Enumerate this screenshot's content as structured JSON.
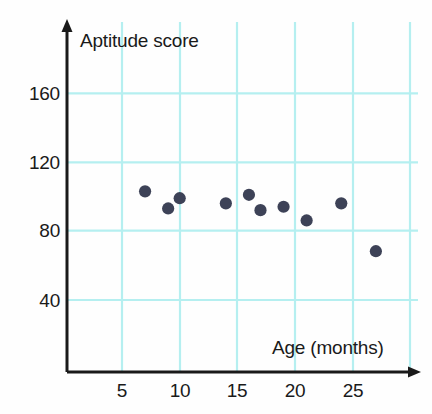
{
  "chart_data": {
    "type": "scatter",
    "title": "",
    "xlabel": "Age (months)",
    "ylabel": "Aptitude score",
    "xlim": [
      0,
      30
    ],
    "ylim": [
      0,
      180
    ],
    "xticks": [
      5,
      10,
      15,
      20,
      25
    ],
    "yticks": [
      40,
      80,
      120,
      160
    ],
    "xtick_labels": [
      "5",
      "10",
      "15",
      "20",
      "25"
    ],
    "ytick_labels": [
      "40",
      "80",
      "120",
      "160"
    ],
    "grid": true,
    "grid_color": "#b5eff0",
    "legend": "none",
    "marker_color": "#3d4257",
    "axis_color": "#1a1a1a",
    "points": [
      {
        "x": 7,
        "y": 103
      },
      {
        "x": 9,
        "y": 93
      },
      {
        "x": 10,
        "y": 99
      },
      {
        "x": 14,
        "y": 96
      },
      {
        "x": 16,
        "y": 101
      },
      {
        "x": 17,
        "y": 92
      },
      {
        "x": 19,
        "y": 94
      },
      {
        "x": 21,
        "y": 86
      },
      {
        "x": 24,
        "y": 96
      },
      {
        "x": 27,
        "y": 68
      }
    ]
  },
  "labels": {
    "y_160": "160",
    "y_120": "120",
    "y_80": "80",
    "y_40": "40",
    "x_5": "5",
    "x_10": "10",
    "x_15": "15",
    "x_20": "20",
    "x_25": "25",
    "y_axis_title": "Aptitude score",
    "x_axis_title": "Age (months)"
  }
}
